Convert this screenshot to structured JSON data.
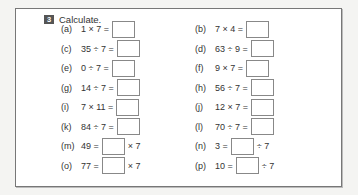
{
  "exercise": {
    "number": "3",
    "title": "Calculate.",
    "problems": [
      {
        "id": "a",
        "label": "(a)",
        "before": "1 × 7 =",
        "after": "",
        "col": 0,
        "row": 0
      },
      {
        "id": "b",
        "label": "(b)",
        "before": "7 × 4 =",
        "after": "",
        "col": 1,
        "row": 0
      },
      {
        "id": "c",
        "label": "(c)",
        "before": "35 ÷ 7 =",
        "after": "",
        "col": 0,
        "row": 1
      },
      {
        "id": "d",
        "label": "(d)",
        "before": "63 ÷ 9 =",
        "after": "",
        "col": 1,
        "row": 1
      },
      {
        "id": "e",
        "label": "(e)",
        "before": "0 ÷ 7 =",
        "after": "",
        "col": 0,
        "row": 2
      },
      {
        "id": "f",
        "label": "(f)",
        "before": "9 × 7 =",
        "after": "",
        "col": 1,
        "row": 2
      },
      {
        "id": "g",
        "label": "(g)",
        "before": "14 ÷ 7 =",
        "after": "",
        "col": 0,
        "row": 3
      },
      {
        "id": "h",
        "label": "(h)",
        "before": "56 ÷ 7 =",
        "after": "",
        "col": 1,
        "row": 3
      },
      {
        "id": "i",
        "label": "(i)",
        "before": "7 × 11 =",
        "after": "",
        "col": 0,
        "row": 4
      },
      {
        "id": "j",
        "label": "(j)",
        "before": "12 × 7 =",
        "after": "",
        "col": 1,
        "row": 4
      },
      {
        "id": "k",
        "label": "(k)",
        "before": "84 ÷ 7 =",
        "after": "",
        "col": 0,
        "row": 5
      },
      {
        "id": "l",
        "label": "(l)",
        "before": "70 ÷ 7 =",
        "after": "",
        "col": 1,
        "row": 5
      },
      {
        "id": "m",
        "label": "(m)",
        "before": "49 =",
        "after": "× 7",
        "col": 0,
        "row": 6
      },
      {
        "id": "n",
        "label": "(n)",
        "before": "3 =",
        "after": "÷ 7",
        "col": 1,
        "row": 6
      },
      {
        "id": "o",
        "label": "(o)",
        "before": "77 =",
        "after": "× 7",
        "col": 0,
        "row": 7
      },
      {
        "id": "p",
        "label": "(p)",
        "before": "10 =",
        "after": "÷ 7",
        "col": 1,
        "row": 7
      }
    ]
  }
}
